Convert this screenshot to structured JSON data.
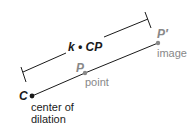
{
  "diagram": {
    "title": "Dilation",
    "colors": {
      "primary": "#1a1a1a",
      "secondary": "#888888",
      "background": "#ffffff"
    },
    "points": {
      "center": {
        "symbol": "C",
        "caption_line1": "center of",
        "caption_line2": "dilation",
        "x": 32,
        "y": 96
      },
      "point": {
        "symbol": "P",
        "caption": "point",
        "x": 85,
        "y": 73
      },
      "image": {
        "symbol": "P′",
        "caption": "image",
        "x": 158,
        "y": 43
      }
    },
    "measure_label": "k • CP"
  }
}
